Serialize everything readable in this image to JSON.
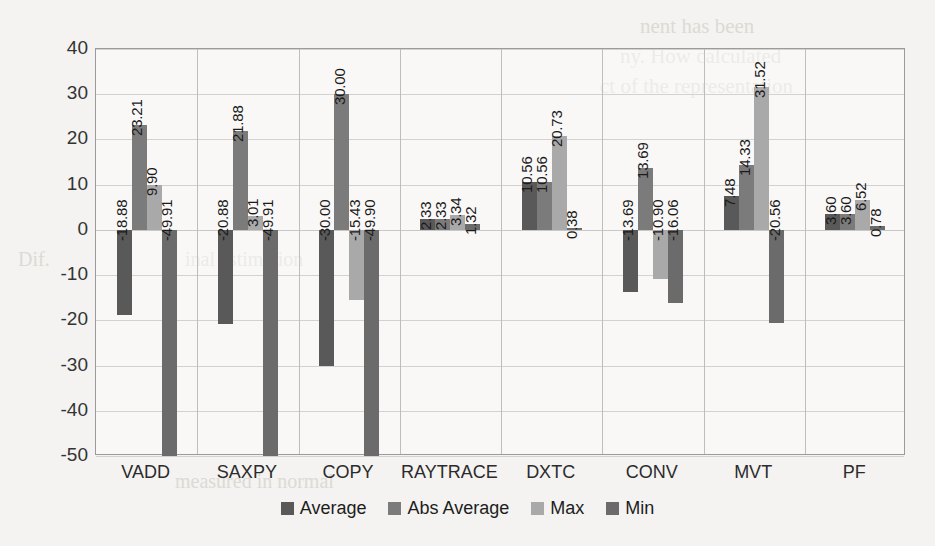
{
  "chart_data": {
    "type": "bar",
    "title": "",
    "xlabel": "",
    "ylabel": "Percentage Error",
    "ylim": [
      -50,
      40
    ],
    "ytick_step": 10,
    "grid": true,
    "legend_position": "bottom",
    "categories": [
      "VADD",
      "SAXPY",
      "COPY",
      "RAYTRACE",
      "DXTC",
      "CONV",
      "MVT",
      "PF"
    ],
    "ytick_labels": [
      "40",
      "30",
      "20",
      "10",
      "0",
      "-10",
      "-20",
      "-30",
      "-40",
      "-50"
    ],
    "series": [
      {
        "name": "Average",
        "color": "#595959",
        "values": [
          -18.88,
          -20.88,
          -30.0,
          2.33,
          10.56,
          -13.69,
          7.48,
          3.6
        ],
        "labels": [
          "-18.88",
          "-20.88",
          "-30.00",
          "2.33",
          "10.56",
          "-13.69",
          "7.48",
          "3.60"
        ]
      },
      {
        "name": "Abs Average",
        "color": "#7b7b7b",
        "values": [
          23.21,
          21.88,
          30.0,
          2.33,
          10.56,
          13.69,
          14.33,
          3.6
        ],
        "labels": [
          "23.21",
          "21.88",
          "30.00",
          "2.33",
          "10.56",
          "13.69",
          "14.33",
          "3.60"
        ]
      },
      {
        "name": "Max",
        "color": "#a9a9a9",
        "values": [
          9.9,
          3.01,
          -15.43,
          3.34,
          20.73,
          -10.9,
          31.52,
          6.52
        ],
        "labels": [
          "9.90",
          "3.01",
          "-15.43",
          "3.34",
          "20.73",
          "-10.90",
          "31.52",
          "6.52"
        ]
      },
      {
        "name": "Min",
        "color": "#6b6b6b",
        "values": [
          -49.91,
          -49.91,
          -49.9,
          1.32,
          0.38,
          -16.06,
          -20.56,
          0.78
        ],
        "labels": [
          "-49.91",
          "-49.91",
          "-49.90",
          "1.32",
          "0.38",
          "-16.06",
          "-20.56",
          "0.78"
        ]
      }
    ]
  },
  "legend": {
    "items": [
      {
        "label": "Average"
      },
      {
        "label": "Abs Average"
      },
      {
        "label": "Max"
      },
      {
        "label": "Min"
      }
    ]
  },
  "background_bleed": [
    {
      "text": "nent has been",
      "x": 640,
      "y": 14,
      "size": 21
    },
    {
      "text": "ny. How calculated",
      "x": 620,
      "y": 44,
      "size": 21
    },
    {
      "text": "ct of the representation",
      "x": 600,
      "y": 74,
      "size": 21
    },
    {
      "text": "inal estimation",
      "x": 185,
      "y": 248,
      "size": 20
    },
    {
      "text": "measured in normal",
      "x": 175,
      "y": 470,
      "size": 20
    },
    {
      "text": "Dif.",
      "x": 18,
      "y": 248,
      "size": 20
    }
  ]
}
